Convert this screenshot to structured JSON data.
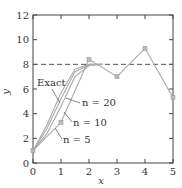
{
  "chart_data": {
    "type": "line",
    "title": "",
    "xlabel": "x",
    "ylabel": "y",
    "xlim": [
      0,
      5
    ],
    "ylim": [
      0,
      12
    ],
    "xticks": [
      0,
      1,
      2,
      3,
      4,
      5
    ],
    "yticks": [
      0,
      2,
      4,
      6,
      8,
      10,
      12
    ],
    "grid": false,
    "reference_line": {
      "y": 8,
      "style": "dashed"
    },
    "series": [
      {
        "name": "n = 5",
        "x": [
          0,
          1,
          2,
          3,
          4,
          5
        ],
        "y": [
          1,
          3.3,
          8.4,
          7.0,
          9.3,
          5.3
        ],
        "markers": true
      },
      {
        "name": "n = 10",
        "x": [
          0,
          0.5,
          1,
          1.5,
          2,
          2.5
        ],
        "y": [
          1,
          2.4,
          4.6,
          7.0,
          7.9,
          8.0
        ]
      },
      {
        "name": "n = 20",
        "x": [
          0,
          0.5,
          1,
          1.5,
          2,
          2.5
        ],
        "y": [
          1,
          2.8,
          5.2,
          7.4,
          7.95,
          8.0
        ]
      },
      {
        "name": "Exact",
        "x": [
          0,
          0.5,
          1,
          1.5,
          2,
          2.5
        ],
        "y": [
          1,
          3.1,
          5.7,
          7.6,
          8.0,
          8.0
        ]
      }
    ],
    "annotations": [
      "Exact",
      "n = 20",
      "n = 10",
      "n = 5"
    ]
  }
}
